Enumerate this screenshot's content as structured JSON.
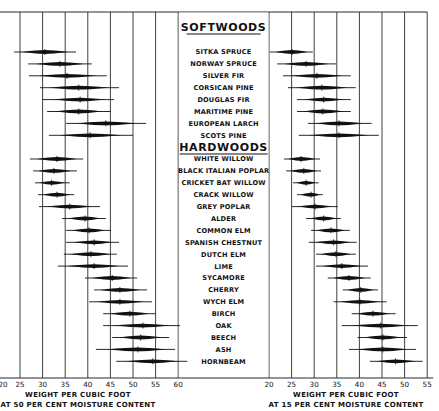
{
  "chart_data": {
    "type": "range-bar",
    "groups": [
      {
        "name": "SOFTWOODS",
        "items": [
          {
            "label": "SITKA SPRUCE",
            "left": [
              23.7,
              30.5,
              37.4
            ],
            "right": [
              20.2,
              25.1,
              29.7
            ]
          },
          {
            "label": "NORWAY SPRUCE",
            "left": [
              26.8,
              33.8,
              40.9
            ],
            "right": [
              21.8,
              28.2,
              34.8
            ]
          },
          {
            "label": "SILVER FIR",
            "left": [
              27.0,
              35.4,
              44.2
            ],
            "right": [
              23.1,
              30.6,
              38.1
            ]
          },
          {
            "label": "CORSICAN PINE",
            "left": [
              29.4,
              38.0,
              46.9
            ],
            "right": [
              24.2,
              31.7,
              39.2
            ]
          },
          {
            "label": "DOUGLAS FIR",
            "left": [
              30.0,
              38.3,
              45.8
            ],
            "right": [
              26.2,
              32.1,
              38.1
            ]
          },
          {
            "label": "MARITIME PINE",
            "left": [
              31.0,
              38.0,
              45.0
            ],
            "right": [
              26.2,
              31.9,
              38.1
            ]
          },
          {
            "label": "EUROPEAN LARCH",
            "left": [
              35.2,
              44.0,
              52.9
            ],
            "right": [
              28.6,
              35.5,
              42.7
            ]
          },
          {
            "label": "SCOTS PINE",
            "left": [
              31.4,
              40.5,
              50.0
            ],
            "right": [
              26.6,
              35.5,
              44.3
            ]
          }
        ]
      },
      {
        "name": "HARDWOODS",
        "items": [
          {
            "label": "WHITE WILLOW",
            "left": [
              27.2,
              33.2,
              39.0
            ],
            "right": [
              23.3,
              27.1,
              31.3
            ]
          },
          {
            "label": "BLACK ITALIAN POPLAR",
            "left": [
              27.9,
              32.5,
              37.6
            ],
            "right": [
              23.8,
              27.7,
              31.5
            ]
          },
          {
            "label": "CRICKET BAT WILLOW",
            "left": [
              28.3,
              32.0,
              36.0
            ],
            "right": [
              25.3,
              28.2,
              31.0
            ]
          },
          {
            "label": "CRACK WILLOW",
            "left": [
              29.0,
              33.2,
              37.0
            ],
            "right": [
              26.2,
              29.3,
              31.9
            ]
          },
          {
            "label": "GREY POPLAR",
            "left": [
              29.2,
              36.0,
              42.7
            ],
            "right": [
              25.1,
              30.2,
              35.2
            ]
          },
          {
            "label": "ALDER",
            "left": [
              34.3,
              39.4,
              44.0
            ],
            "right": [
              28.2,
              32.1,
              35.9
            ]
          },
          {
            "label": "COMMON ELM",
            "left": [
              35.2,
              40.3,
              45.1
            ],
            "right": [
              29.3,
              33.7,
              37.9
            ]
          },
          {
            "label": "SPANISH CHESTNUT",
            "left": [
              35.2,
              41.4,
              46.9
            ],
            "right": [
              28.8,
              34.3,
              39.4
            ]
          },
          {
            "label": "DUTCH ELM",
            "left": [
              34.7,
              40.7,
              46.4
            ],
            "right": [
              30.4,
              34.8,
              39.2
            ]
          },
          {
            "label": "LIME",
            "left": [
              33.4,
              41.4,
              48.9
            ],
            "right": [
              30.4,
              36.1,
              41.9
            ]
          },
          {
            "label": "SYCAMORE",
            "left": [
              39.4,
              45.4,
              50.9
            ],
            "right": [
              33.0,
              37.7,
              42.5
            ]
          },
          {
            "label": "CHERRY",
            "left": [
              41.4,
              47.1,
              53.1
            ],
            "right": [
              36.3,
              40.3,
              44.1
            ]
          },
          {
            "label": "WYCH ELM",
            "left": [
              40.3,
              47.1,
              54.2
            ],
            "right": [
              34.3,
              40.1,
              46.0
            ]
          },
          {
            "label": "BIRCH",
            "left": [
              43.4,
              49.3,
              55.0
            ],
            "right": [
              38.3,
              43.0,
              48.0
            ]
          },
          {
            "label": "OAK",
            "left": [
              43.4,
              52.2,
              60.4
            ],
            "right": [
              36.1,
              44.7,
              52.9
            ]
          },
          {
            "label": "BEECH",
            "left": [
              45.4,
              51.7,
              58.0
            ],
            "right": [
              39.6,
              45.2,
              50.5
            ]
          },
          {
            "label": "ASH",
            "left": [
              41.8,
              51.1,
              59.3
            ],
            "right": [
              37.7,
              45.2,
              52.5
            ]
          },
          {
            "label": "HORNBEAM",
            "left": [
              46.3,
              54.4,
              62.0
            ],
            "right": [
              42.3,
              48.0,
              54.0
            ]
          }
        ]
      }
    ],
    "left_axis": {
      "ticks": [
        20,
        25,
        30,
        35,
        40,
        45,
        50,
        55,
        60
      ],
      "xlim": [
        20,
        60
      ],
      "xlabel_line1": "WEIGHT PER CUBIC FOOT",
      "xlabel_line2": "AT 50 PER CENT MOISTURE CONTENT"
    },
    "right_axis": {
      "ticks": [
        20,
        25,
        30,
        35,
        40,
        45,
        50,
        55
      ],
      "xlim": [
        20,
        55
      ],
      "xlabel_line1": "WEIGHT PER CUBIC FOOT",
      "xlabel_line2": "AT 15 PER CENT MOISTURE CONTENT"
    },
    "value_format": "[min, mean, max] lb per cubic foot",
    "grid": true,
    "legend": "none"
  },
  "colors": {
    "ink": "#111111",
    "grid": "#2a2a2a",
    "background": "#ffffff"
  }
}
